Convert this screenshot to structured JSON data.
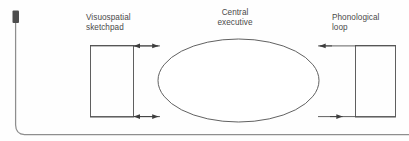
{
  "figure": {
    "type": "working-memory-model-diagram",
    "background_color": "#fefefe",
    "ink_color": "#4a4a4a",
    "labels": {
      "visuospatial_sketchpad": "Visuospatial\nsketchpad",
      "central_executive": "Central\nexecutive",
      "phonological_loop": "Phonological\nloop"
    },
    "components": [
      {
        "id": "visuospatial-sketchpad-box",
        "shape": "rectangle",
        "label": "Visuospatial sketchpad"
      },
      {
        "id": "central-executive-ellipse",
        "shape": "ellipse",
        "label": "Central executive"
      },
      {
        "id": "phonological-loop-box",
        "shape": "rectangle",
        "label": "Phonological loop"
      }
    ],
    "connectors": [
      {
        "id": "top-left-connector",
        "from": "visuospatial-sketchpad-box",
        "to": "central-executive-ellipse",
        "direction": "bidirectional"
      },
      {
        "id": "bottom-left-connector",
        "from": "visuospatial-sketchpad-box",
        "to": "central-executive-ellipse",
        "direction": "bidirectional"
      },
      {
        "id": "top-right-connector",
        "from": "phonological-loop-box",
        "to": "central-executive-ellipse",
        "direction": "leftward"
      },
      {
        "id": "bottom-right-connector",
        "from": "central-executive-ellipse",
        "to": "phonological-loop-box",
        "direction": "rightward"
      }
    ],
    "scan_artifact": {
      "id": "page-edge-artifact",
      "description": "dark scanned page-edge bracket along left and bottom margins"
    }
  }
}
